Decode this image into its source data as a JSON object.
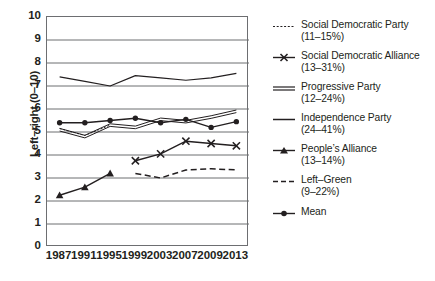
{
  "chart_data": {
    "type": "line",
    "title": "",
    "xlabel": "",
    "ylabel": "Left–right (0–10)",
    "ylim": [
      0,
      10
    ],
    "yticks": [
      "0",
      "1",
      "2",
      "3",
      "4",
      "5",
      "6",
      "7",
      "8",
      "9",
      "10"
    ],
    "grid": true,
    "legend_position": "right",
    "categories": [
      "1987",
      "1991",
      "1995",
      "1999",
      "2003",
      "2007",
      "2009",
      "2013"
    ],
    "series": [
      {
        "name": "Social Democratic Party",
        "range_label": "(11–15%)",
        "legend_label": "Social Democratic Party",
        "style": "dotted",
        "marker": "none",
        "values": [
          5.15,
          4.85,
          5.3,
          null,
          null,
          null,
          null,
          null
        ]
      },
      {
        "name": "Social Democratic Alliance",
        "range_label": "(13–31%)",
        "legend_label": "Social Democratic Alliance",
        "style": "solid",
        "marker": "x",
        "values": [
          null,
          null,
          null,
          3.75,
          4.05,
          4.6,
          4.5,
          4.4
        ]
      },
      {
        "name": "Progressive Party",
        "range_label": "(12–24%)",
        "legend_label": "Progressive Party",
        "style": "double",
        "marker": "none",
        "values": [
          5.1,
          4.8,
          5.3,
          5.2,
          5.55,
          5.45,
          5.65,
          5.9
        ]
      },
      {
        "name": "Independence Party",
        "range_label": "(24–41%)",
        "legend_label": "Independence Party",
        "style": "solid",
        "marker": "none",
        "values": [
          7.4,
          7.2,
          7.0,
          7.45,
          7.35,
          7.25,
          7.35,
          7.55
        ]
      },
      {
        "name": "People's Alliance",
        "range_label": "(13–14%)",
        "legend_label": "People’s Alliance",
        "style": "solid",
        "marker": "triangle",
        "values": [
          2.25,
          2.6,
          3.2,
          null,
          null,
          null,
          null,
          null
        ]
      },
      {
        "name": "Left–Green",
        "range_label": "(9–22%)",
        "legend_label": "Left–Green",
        "style": "dashed",
        "marker": "none",
        "values": [
          null,
          null,
          null,
          3.2,
          3.0,
          3.35,
          3.4,
          3.35
        ]
      },
      {
        "name": "Mean",
        "range_label": "",
        "legend_label": "Mean",
        "style": "solid",
        "marker": "dot",
        "values": [
          5.4,
          5.4,
          5.5,
          5.6,
          5.4,
          5.55,
          5.2,
          5.45
        ]
      }
    ]
  },
  "colors": {
    "ink": "#231f20",
    "grid": "#6d6e71",
    "frame": "#6d6e71"
  }
}
